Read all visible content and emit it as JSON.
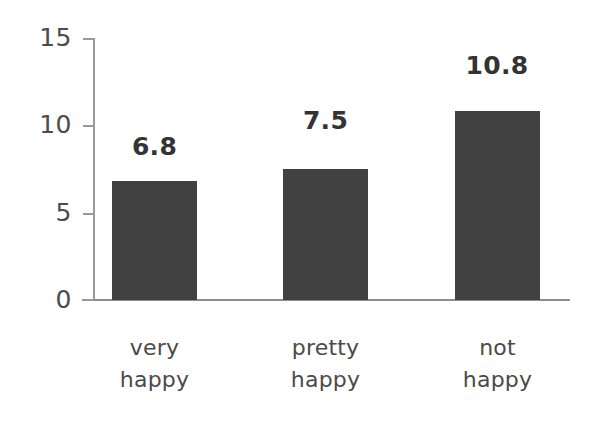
{
  "chart_data": {
    "type": "bar",
    "title": "",
    "subtitle": "",
    "xlabel": "",
    "ylabel": "",
    "categories": [
      "very happy",
      "pretty happy",
      "not happy"
    ],
    "category_lines": [
      [
        "very",
        "happy"
      ],
      [
        "pretty",
        "happy"
      ],
      [
        "not",
        "happy"
      ]
    ],
    "values": [
      6.8,
      7.5,
      10.8
    ],
    "value_labels": [
      "6.8",
      "7.5",
      "10.8"
    ],
    "ylim": [
      0,
      15
    ],
    "yticks": [
      0,
      5,
      10,
      15
    ],
    "ytick_labels": [
      "0",
      "5",
      "10",
      "15"
    ],
    "grid": false,
    "legend": null,
    "bar_color": "#414141",
    "axis_color": "#9a9a9a",
    "text_color": "#4a4a4a",
    "background": "#ffffff"
  }
}
